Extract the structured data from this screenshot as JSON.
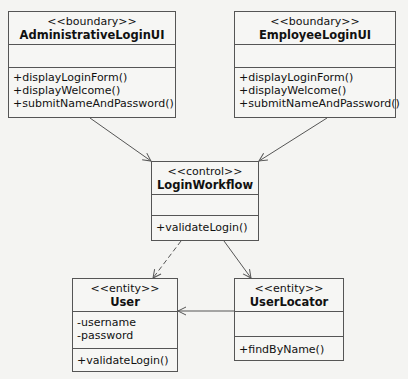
{
  "classes": {
    "admin": {
      "stereotype": "<<boundary>>",
      "name": "AdministrativeLoginUI",
      "attributes": [],
      "operations": [
        "+displayLoginForm()",
        "+displayWelcome()",
        "+submitNameAndPassword()"
      ]
    },
    "employee": {
      "stereotype": "<<boundary>>",
      "name": "EmployeeLoginUI",
      "attributes": [],
      "operations": [
        "+displayLoginForm()",
        "+displayWelcome()",
        "+submitNameAndPassword()"
      ]
    },
    "workflow": {
      "stereotype": "<<control>>",
      "name": "LoginWorkflow",
      "attributes": [],
      "operations": [
        "+validateLogin()"
      ]
    },
    "user": {
      "stereotype": "<<entity>>",
      "name": "User",
      "attributes": [
        "-username",
        "-password"
      ],
      "operations": [
        "+validateLogin()"
      ]
    },
    "locator": {
      "stereotype": "<<entity>>",
      "name": "UserLocator",
      "attributes": [],
      "operations": [
        "+findByName()"
      ]
    }
  },
  "relationships": [
    {
      "from": "AdministrativeLoginUI",
      "to": "LoginWorkflow",
      "style": "solid",
      "arrow": "open"
    },
    {
      "from": "EmployeeLoginUI",
      "to": "LoginWorkflow",
      "style": "solid",
      "arrow": "open"
    },
    {
      "from": "LoginWorkflow",
      "to": "User",
      "style": "dashed",
      "arrow": "open"
    },
    {
      "from": "LoginWorkflow",
      "to": "UserLocator",
      "style": "solid",
      "arrow": "open"
    },
    {
      "from": "UserLocator",
      "to": "User",
      "style": "solid",
      "arrow": "open"
    }
  ],
  "colors": {
    "line": "#555555",
    "background": "#f4f4f2",
    "box": "#f6f6f4"
  }
}
